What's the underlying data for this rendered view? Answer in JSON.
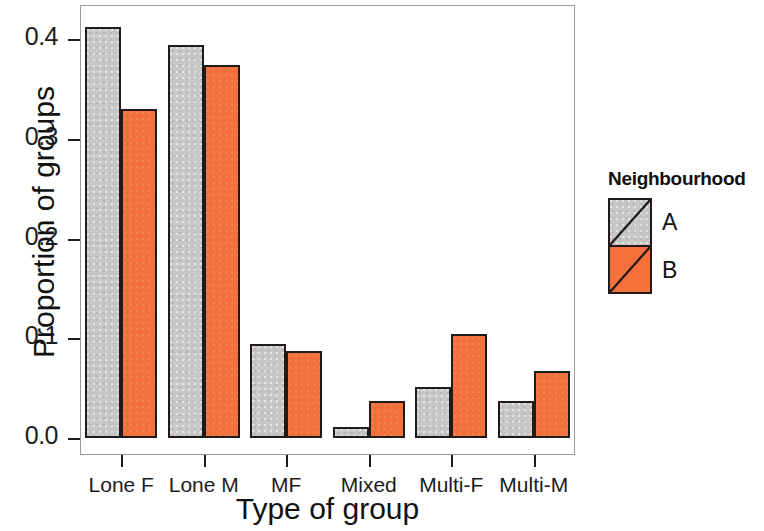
{
  "chart_data": {
    "type": "bar",
    "title": "",
    "subtitle": "",
    "xlabel": "Type of group",
    "ylabel": "Proportion of groups",
    "categories": [
      "Lone F",
      "Lone M",
      "MF",
      "Mixed",
      "Multi-F",
      "Multi-M"
    ],
    "series": [
      {
        "name": "A",
        "color": "#c6c6c6",
        "values": [
          0.412,
          0.394,
          0.094,
          0.011,
          0.051,
          0.037
        ]
      },
      {
        "name": "B",
        "color": "#f4713c",
        "values": [
          0.33,
          0.374,
          0.087,
          0.037,
          0.104,
          0.067
        ]
      }
    ],
    "ylim": [
      0.0,
      0.44
    ],
    "yticks": [
      "0.0",
      "0.1",
      "0.2",
      "0.3",
      "0.4"
    ],
    "ytick_values": [
      0.0,
      0.1,
      0.2,
      0.3,
      0.4
    ],
    "grid": false,
    "legend": {
      "title": "Neighbourhood",
      "position": "right",
      "entries": [
        {
          "label": "A",
          "color": "#c6c6c6"
        },
        {
          "label": "B",
          "color": "#f4713c"
        }
      ]
    },
    "frame": true,
    "bar_edge_color": "#221a17"
  }
}
